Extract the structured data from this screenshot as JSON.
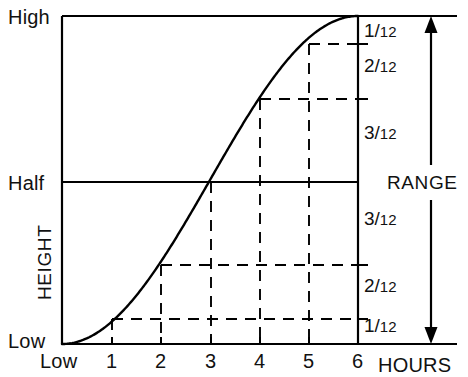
{
  "chart_data": {
    "type": "line",
    "title": "",
    "xlabel": "HOURS",
    "ylabel": "HEIGHT",
    "x": [
      0,
      1,
      2,
      3,
      4,
      5,
      6
    ],
    "xtick_labels": [
      "Low",
      "1",
      "2",
      "3",
      "4",
      "5",
      "6"
    ],
    "y_axis_labels": [
      "High",
      "Half",
      "Low"
    ],
    "ylim": [
      0,
      1
    ],
    "xlim": [
      0,
      6
    ],
    "grid": "dashed-guides",
    "legend": "none",
    "series": [
      {
        "name": "Tide height (rule of twelfths)",
        "values": [
          0,
          0.08333,
          0.25,
          0.5,
          0.75,
          0.91667,
          1.0
        ],
        "value_labels": [
          "0",
          "1/12",
          "3/12",
          "6/12",
          "9/12",
          "11/12",
          "12/12"
        ]
      }
    ],
    "hourly_fractions": [
      "1/12",
      "2/12",
      "3/12",
      "3/12",
      "2/12",
      "1/12"
    ],
    "right_axis_labels_upper": [
      "1/12",
      "2/12",
      "3/12"
    ],
    "right_axis_labels_lower": [
      "3/12",
      "2/12",
      "1/12"
    ],
    "annotations": [
      "RANGE"
    ]
  },
  "axis": {
    "y_high": "High",
    "y_half": "Half",
    "y_low": "Low",
    "y_title": "HEIGHT",
    "x_title": "HOURS",
    "x_origin": "Low",
    "xticks": [
      "1",
      "2",
      "3",
      "4",
      "5",
      "6"
    ]
  },
  "fractions": {
    "upper": [
      {
        "num": "1",
        "den": "12"
      },
      {
        "num": "2",
        "den": "12"
      },
      {
        "num": "3",
        "den": "12"
      }
    ],
    "lower": [
      {
        "num": "3",
        "den": "12"
      },
      {
        "num": "2",
        "den": "12"
      },
      {
        "num": "1",
        "den": "12"
      }
    ]
  },
  "range": {
    "label": "RANGE"
  },
  "colors": {
    "ink": "#000000",
    "paper": "#ffffff"
  }
}
